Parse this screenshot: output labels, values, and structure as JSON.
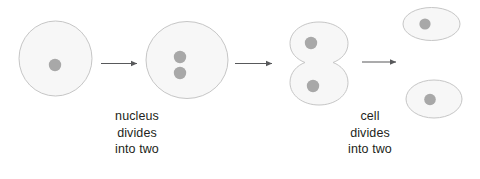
{
  "diagram": {
    "background_color": "#ffffff",
    "cell_fill_color": "#f7f7f7",
    "cell_stroke_color": "#c6c6c6",
    "nucleus_color": "#a8a8a8",
    "arrow_color": "#58595b",
    "text_color": "#231f20",
    "stages": [
      {
        "name": "parent-cell",
        "shape": "circle",
        "nuclei": 1,
        "description": "single round cell with one nucleus"
      },
      {
        "name": "cell-with-two-nuclei",
        "shape": "circle",
        "nuclei": 2,
        "description": "round cell with two nuclei stacked vertically"
      },
      {
        "name": "dividing-cell",
        "shape": "figure-eight",
        "nuclei": 2,
        "description": "cell pinched into two lobes, each with a nucleus"
      },
      {
        "name": "daughter-cell-top",
        "shape": "ellipse",
        "nuclei": 1,
        "description": "upper daughter cell with one nucleus"
      },
      {
        "name": "daughter-cell-bottom",
        "shape": "ellipse",
        "nuclei": 1,
        "description": "lower daughter cell with one nucleus"
      }
    ],
    "arrows": [
      {
        "name": "arrow-1",
        "direction": "right"
      },
      {
        "name": "arrow-2",
        "direction": "right"
      },
      {
        "name": "arrow-3",
        "direction": "right"
      }
    ],
    "captions": [
      {
        "id": "nucleus-divides",
        "lines": [
          "nucleus",
          "divides",
          "into two"
        ]
      },
      {
        "id": "cell-divides",
        "lines": [
          "cell",
          "divides",
          "into two"
        ]
      }
    ]
  }
}
